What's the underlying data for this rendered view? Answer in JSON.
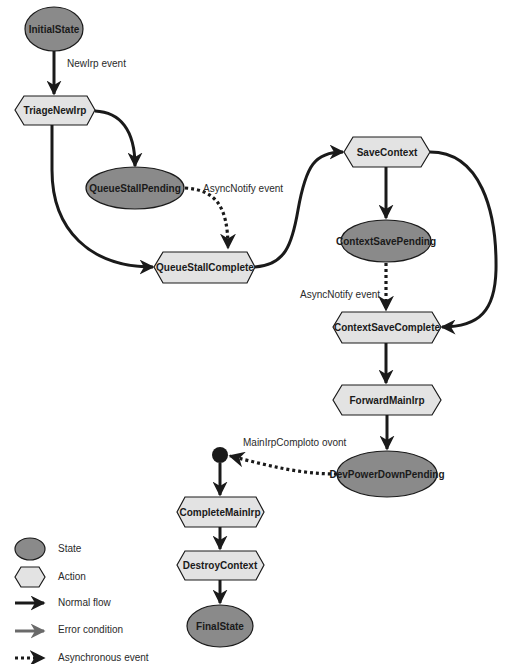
{
  "diagram": {
    "nodes": {
      "initial_state": "InitialState",
      "triage_new_irp": "TriageNewIrp",
      "queue_stall_pending": "QueueStallPending",
      "queue_stall_complete": "QueueStallComplete",
      "save_context": "SaveContext",
      "context_save_pending": "ContextSavePending",
      "context_save_complete": "ContextSaveComplete",
      "forward_main_irp": "ForwardMainIrp",
      "dev_power_down_pending": "DevPowerDownPending",
      "complete_main_irp": "CompleteMainIrp",
      "destroy_context": "DestroyContext",
      "final_state": "FinalState"
    },
    "edge_labels": {
      "new_irp_event": "NewIrp event",
      "async_notify_event_1": "AsyncNotify event",
      "async_notify_event_2": "AsyncNotify event",
      "main_irp_complete_event": "MainIrpComploto ovont"
    },
    "edges": [
      {
        "from": "InitialState",
        "to": "TriageNewIrp",
        "type": "normal",
        "label": "NewIrp event"
      },
      {
        "from": "TriageNewIrp",
        "to": "QueueStallPending",
        "type": "normal"
      },
      {
        "from": "TriageNewIrp",
        "to": "QueueStallComplete",
        "type": "normal"
      },
      {
        "from": "QueueStallPending",
        "to": "QueueStallComplete",
        "type": "async",
        "label": "AsyncNotify event"
      },
      {
        "from": "QueueStallComplete",
        "to": "SaveContext",
        "type": "normal"
      },
      {
        "from": "SaveContext",
        "to": "ContextSavePending",
        "type": "normal"
      },
      {
        "from": "SaveContext",
        "to": "ContextSaveComplete",
        "type": "normal"
      },
      {
        "from": "ContextSavePending",
        "to": "ContextSaveComplete",
        "type": "async",
        "label": "AsyncNotify event"
      },
      {
        "from": "ContextSaveComplete",
        "to": "ForwardMainIrp",
        "type": "normal"
      },
      {
        "from": "ForwardMainIrp",
        "to": "DevPowerDownPending",
        "type": "normal"
      },
      {
        "from": "DevPowerDownPending",
        "to": "junction",
        "type": "async",
        "label": "MainIrpComploto ovont"
      },
      {
        "from": "junction",
        "to": "CompleteMainIrp",
        "type": "normal"
      },
      {
        "from": "CompleteMainIrp",
        "to": "DestroyContext",
        "type": "normal"
      },
      {
        "from": "DestroyContext",
        "to": "FinalState",
        "type": "normal"
      }
    ]
  },
  "legend": {
    "state": "State",
    "action": "Action",
    "normal_flow": "Normal flow",
    "error_condition": "Error condition",
    "async_event": "Asynchronous event"
  },
  "colors": {
    "state_fill": "#8a8a8a",
    "action_fill": "#e3e3e3",
    "stroke": "#1a1a1a",
    "error_stroke": "#6a6a6a"
  }
}
